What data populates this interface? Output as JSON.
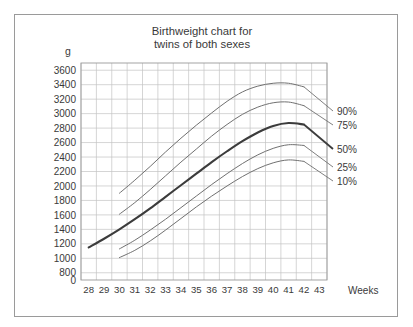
{
  "figure": {
    "title_line1": "Birthweight chart for",
    "title_line2": "twins of both sexes",
    "unit_label": "g",
    "xaxis_name": "Weeks",
    "border_color": "#9a9a9a",
    "grid_color": "#c3c3c3",
    "background": "#ffffff"
  },
  "chart_data": {
    "type": "line",
    "title": "Birthweight chart for twins of both sexes",
    "xlabel": "Weeks",
    "ylabel": "g",
    "grid": true,
    "legend_position": "right-inline",
    "xlim": [
      28,
      44
    ],
    "ylim": [
      700,
      3700
    ],
    "xticks": [
      28,
      29,
      30,
      31,
      32,
      33,
      34,
      35,
      36,
      37,
      38,
      39,
      40,
      41,
      42,
      43
    ],
    "xtick_labels": [
      "28",
      "29",
      "30",
      "31",
      "32",
      "33",
      "34",
      "35",
      "36",
      "37",
      "38",
      "39",
      "40",
      "41",
      "42",
      "43"
    ],
    "yticks": [
      700,
      800,
      1000,
      1200,
      1400,
      1600,
      1800,
      2000,
      2200,
      2400,
      2600,
      2800,
      3000,
      3200,
      3400,
      3600
    ],
    "ytick_labels": [
      "0",
      "800",
      "1000",
      "1200",
      "1400",
      "1600",
      "1800",
      "2000",
      "2200",
      "2400",
      "2600",
      "2800",
      "3000",
      "3200",
      "3400",
      "3600"
    ],
    "series": [
      {
        "name": "90%",
        "label": "90%",
        "color": "#707070",
        "emphasis": false,
        "x": [
          30,
          31,
          32,
          33,
          34,
          35,
          36,
          37,
          38,
          39,
          40,
          41,
          42
        ],
        "values": [
          1900,
          2080,
          2270,
          2470,
          2660,
          2840,
          3010,
          3170,
          3300,
          3380,
          3420,
          3420,
          3370
        ]
      },
      {
        "name": "75%",
        "label": "75%",
        "color": "#707070",
        "emphasis": false,
        "x": [
          30,
          31,
          32,
          33,
          34,
          35,
          36,
          37,
          38,
          39,
          40,
          41,
          42
        ],
        "values": [
          1610,
          1770,
          1950,
          2140,
          2330,
          2510,
          2690,
          2850,
          2990,
          3090,
          3150,
          3160,
          3110
        ]
      },
      {
        "name": "50%",
        "label": "50%",
        "color": "#3c3c3c",
        "emphasis": true,
        "x": [
          28,
          29,
          30,
          31,
          32,
          33,
          34,
          35,
          36,
          37,
          38,
          39,
          40,
          41,
          42
        ],
        "values": [
          1150,
          1270,
          1400,
          1540,
          1690,
          1850,
          2010,
          2170,
          2330,
          2480,
          2620,
          2740,
          2830,
          2870,
          2850
        ]
      },
      {
        "name": "25%",
        "label": "25%",
        "color": "#707070",
        "emphasis": false,
        "x": [
          30,
          31,
          32,
          33,
          34,
          35,
          36,
          37,
          38,
          39,
          40,
          41,
          42
        ],
        "values": [
          1130,
          1250,
          1390,
          1540,
          1700,
          1860,
          2020,
          2170,
          2310,
          2430,
          2520,
          2570,
          2560
        ]
      },
      {
        "name": "10%",
        "label": "10%",
        "color": "#707070",
        "emphasis": false,
        "x": [
          30,
          31,
          32,
          33,
          34,
          35,
          36,
          37,
          38,
          39,
          40,
          41,
          42
        ],
        "values": [
          1010,
          1110,
          1240,
          1390,
          1550,
          1710,
          1860,
          2000,
          2130,
          2240,
          2320,
          2360,
          2340
        ]
      }
    ]
  }
}
